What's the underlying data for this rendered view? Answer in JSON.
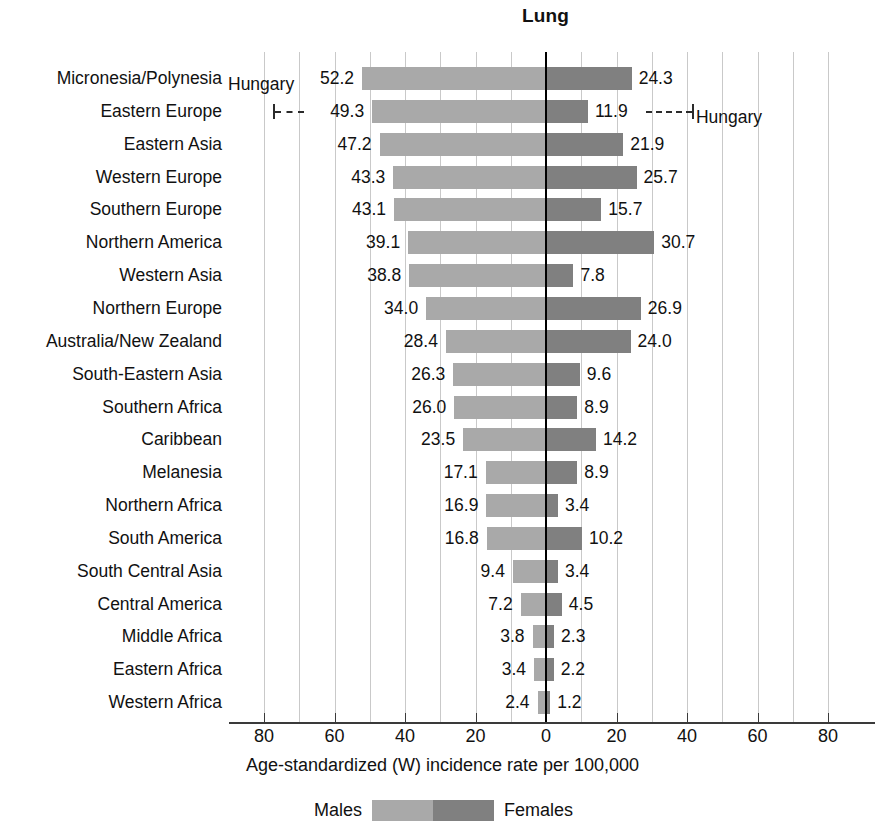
{
  "chart_data": {
    "type": "bar",
    "subtype": "diverging-horizontal-population-pyramid",
    "title": "Lung",
    "xlabel": "Age-standardized (W) incidence rate per 100,000",
    "ylabel": "",
    "xlim": [
      -90,
      90
    ],
    "xticks": [
      80,
      60,
      40,
      20,
      0,
      20,
      40,
      60,
      80
    ],
    "gridline_step": 10,
    "grid": true,
    "legend": {
      "position": "bottom",
      "entries": [
        {
          "name": "Males",
          "color": "#a9a9a9"
        },
        {
          "name": "Females",
          "color": "#808080"
        }
      ]
    },
    "categories": [
      "Micronesia/Polynesia",
      "Eastern Europe",
      "Eastern Asia",
      "Western Europe",
      "Southern Europe",
      "Northern America",
      "Western Asia",
      "Northern Europe",
      "Australia/New Zealand",
      "South-Eastern Asia",
      "Southern Africa",
      "Caribbean",
      "Melanesia",
      "Northern Africa",
      "South America",
      "South Central Asia",
      "Central America",
      "Middle Africa",
      "Eastern Africa",
      "Western Africa"
    ],
    "series": [
      {
        "name": "Males",
        "color": "#a9a9a9",
        "direction": "left",
        "values": [
          52.2,
          49.3,
          47.2,
          43.3,
          43.1,
          39.1,
          38.8,
          34.0,
          28.4,
          26.3,
          26.0,
          23.5,
          17.1,
          16.9,
          16.8,
          9.4,
          7.2,
          3.8,
          3.4,
          2.4
        ]
      },
      {
        "name": "Females",
        "color": "#808080",
        "direction": "right",
        "values": [
          24.3,
          11.9,
          21.9,
          25.7,
          15.7,
          30.7,
          7.8,
          26.9,
          24.0,
          9.6,
          8.9,
          14.2,
          8.9,
          3.4,
          10.2,
          3.4,
          4.5,
          2.3,
          2.2,
          1.2
        ]
      }
    ],
    "annotations": [
      {
        "label": "Hungary",
        "side": "left",
        "label_row": 0,
        "marker_row": 1,
        "marker_value": 77.4
      },
      {
        "label": "Hungary",
        "side": "right",
        "label_row": 1,
        "marker_row": 1,
        "marker_value": 41.4
      }
    ]
  },
  "axis": {
    "tick_labels": [
      "80",
      "60",
      "40",
      "20",
      "0",
      "20",
      "40",
      "60",
      "80"
    ],
    "caption": "Age-standardized (W) incidence rate per 100,000"
  },
  "legend": {
    "males_label": "Males",
    "females_label": "Females"
  },
  "colors": {
    "male": "#a9a9a9",
    "female": "#808080",
    "grid": "#c9c9c9",
    "zero_axis": "#000000",
    "text": "#111111"
  }
}
